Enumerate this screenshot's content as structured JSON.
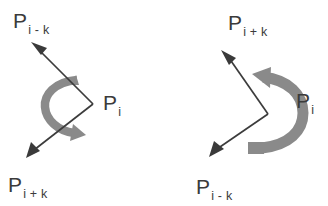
{
  "figure": {
    "title": "",
    "background_color": "#ffffff",
    "line_color": "#3c3c3c",
    "arc_color": "#8a8a8a",
    "text_color": "#3b3b3b",
    "panels": [
      {
        "id": "left",
        "name": "acute-angle-panel",
        "vertex_label": {
          "base": "P",
          "subscript": "i",
          "x": 103,
          "y": 110
        },
        "ray_labels": [
          {
            "base": "P",
            "subscript": "i - k",
            "x": 13,
            "y": 28,
            "name": "label-p-i-minus-k"
          },
          {
            "base": "P",
            "subscript": "i + k",
            "x": 8,
            "y": 192,
            "name": "label-p-i-plus-k"
          }
        ],
        "vertex_point": {
          "x": 93,
          "y": 104
        },
        "rays": [
          {
            "name": "ray-to-p-i-minus-k",
            "tip_x": 31,
            "tip_y": 42
          },
          {
            "name": "ray-to-p-i-plus-k",
            "tip_x": 26,
            "tip_y": 158
          }
        ],
        "sweep": {
          "name": "angle-sweep-arc",
          "direction": "counterclockwise",
          "opening": "right",
          "size": "small"
        }
      },
      {
        "id": "right",
        "name": "reflex-angle-panel",
        "vertex_label": {
          "base": "P",
          "subscript": "i",
          "x": 296,
          "y": 108
        },
        "ray_labels": [
          {
            "base": "P",
            "subscript": "i + k",
            "x": 228,
            "y": 30,
            "name": "label-p-i-plus-k"
          },
          {
            "base": "P",
            "subscript": "i - k",
            "x": 196,
            "y": 194,
            "name": "label-p-i-minus-k"
          }
        ],
        "vertex_point": {
          "x": 268,
          "y": 114
        },
        "rays": [
          {
            "name": "ray-to-p-i-plus-k",
            "tip_x": 221,
            "tip_y": 50
          },
          {
            "name": "ray-to-p-i-minus-k",
            "tip_x": 209,
            "tip_y": 157
          }
        ],
        "sweep": {
          "name": "angle-sweep-arc",
          "direction": "clockwise",
          "opening": "left",
          "size": "large"
        }
      }
    ]
  }
}
